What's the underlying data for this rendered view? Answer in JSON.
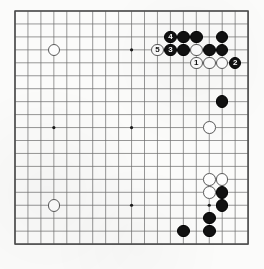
{
  "diagram": {
    "kind": "go-board-diagram",
    "board_size": 19,
    "title": "",
    "caption": "",
    "colors": {
      "board_background": "#fbfbfa",
      "grid_line": "#6b6b6b",
      "border_line": "#4a4a4a",
      "black_stone": "#111111",
      "white_stone": "#fdfdfd",
      "white_stone_outline": "#5a5a5a",
      "black_label_text": "#ffffff",
      "white_label_text": "#111111",
      "star_point": "#1a1a1a"
    },
    "geometry": {
      "origin_x": 15,
      "origin_y": 11,
      "cell": 12.95,
      "stone_diameter": 12.6,
      "star_radius": 1.6
    },
    "star_points": [
      {
        "col": 3,
        "row": 3
      },
      {
        "col": 9,
        "row": 3
      },
      {
        "col": 15,
        "row": 3
      },
      {
        "col": 3,
        "row": 9
      },
      {
        "col": 9,
        "row": 9
      },
      {
        "col": 15,
        "row": 9
      },
      {
        "col": 3,
        "row": 15
      },
      {
        "col": 9,
        "row": 15
      },
      {
        "col": 15,
        "row": 15
      }
    ],
    "move_numbers_visible": [
      "1",
      "2",
      "3",
      "4",
      "5"
    ],
    "stone_counts": {
      "black": 14,
      "white": 11,
      "total": 25
    },
    "stones": [
      {
        "id": "w-ul-star",
        "color": "white",
        "col": 3,
        "row": 3,
        "label": ""
      },
      {
        "id": "b-top-a",
        "color": "black",
        "col": 13,
        "row": 2,
        "label": ""
      },
      {
        "id": "b-top-b",
        "color": "black",
        "col": 14,
        "row": 2,
        "label": ""
      },
      {
        "id": "b-top-c",
        "color": "black",
        "col": 16,
        "row": 2,
        "label": ""
      },
      {
        "id": "b-move-4",
        "color": "black",
        "col": 12,
        "row": 2,
        "label": "4"
      },
      {
        "id": "w-move-5",
        "color": "white",
        "col": 11,
        "row": 3,
        "label": "5"
      },
      {
        "id": "b-move-3",
        "color": "black",
        "col": 12,
        "row": 3,
        "label": "3"
      },
      {
        "id": "b-r3-a",
        "color": "black",
        "col": 13,
        "row": 3,
        "label": ""
      },
      {
        "id": "w-r3-a",
        "color": "white",
        "col": 14,
        "row": 3,
        "label": ""
      },
      {
        "id": "b-r3-b",
        "color": "black",
        "col": 15,
        "row": 3,
        "label": ""
      },
      {
        "id": "b-r3-c",
        "color": "black",
        "col": 16,
        "row": 3,
        "label": ""
      },
      {
        "id": "w-move-1",
        "color": "white",
        "col": 14,
        "row": 4,
        "label": "1"
      },
      {
        "id": "w-r4-a",
        "color": "white",
        "col": 15,
        "row": 4,
        "label": ""
      },
      {
        "id": "w-r4-b",
        "color": "white",
        "col": 16,
        "row": 4,
        "label": ""
      },
      {
        "id": "b-move-2",
        "color": "black",
        "col": 17,
        "row": 4,
        "label": "2"
      },
      {
        "id": "b-right-mid",
        "color": "black",
        "col": 16,
        "row": 7,
        "label": ""
      },
      {
        "id": "w-right-mid",
        "color": "white",
        "col": 15,
        "row": 9,
        "label": ""
      },
      {
        "id": "w-lr-a",
        "color": "white",
        "col": 15,
        "row": 13,
        "label": ""
      },
      {
        "id": "w-lr-b",
        "color": "white",
        "col": 16,
        "row": 13,
        "label": ""
      },
      {
        "id": "w-lr-c",
        "color": "white",
        "col": 15,
        "row": 14,
        "label": ""
      },
      {
        "id": "b-lr-a",
        "color": "black",
        "col": 16,
        "row": 14,
        "label": ""
      },
      {
        "id": "b-lr-b",
        "color": "black",
        "col": 16,
        "row": 15,
        "label": ""
      },
      {
        "id": "b-lr-c",
        "color": "black",
        "col": 15,
        "row": 16,
        "label": ""
      },
      {
        "id": "b-bot-a",
        "color": "black",
        "col": 13,
        "row": 17,
        "label": ""
      },
      {
        "id": "b-bot-b",
        "color": "black",
        "col": 15,
        "row": 17,
        "label": ""
      },
      {
        "id": "w-ll-star",
        "color": "white",
        "col": 3,
        "row": 15,
        "label": ""
      }
    ]
  }
}
